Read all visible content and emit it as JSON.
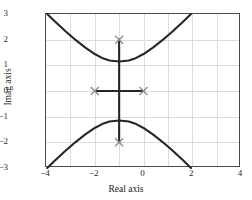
{
  "chart_data": {
    "type": "line",
    "title": "",
    "xlabel": "Real axis",
    "ylabel": "Imag axis",
    "xlim": [
      -4,
      4
    ],
    "ylim": [
      -3,
      3
    ],
    "xticks": [
      -4,
      -2,
      0,
      2,
      4
    ],
    "yticks": [
      3,
      2,
      1,
      0,
      -1,
      -2,
      -3
    ],
    "grid": true,
    "gridlines_x": [
      -4,
      -3,
      -2,
      -1,
      0,
      1,
      2,
      3,
      4
    ],
    "gridlines_y": [
      -3,
      -2,
      -1,
      0,
      1,
      2,
      3
    ],
    "legend": null,
    "colors": {
      "curve": "#262626",
      "marker": "#8a8a8a",
      "grid": "#dcdcdc",
      "frame": "#4a4a4a",
      "background": "#ffffff"
    },
    "markers": [
      {
        "label": "pole",
        "symbol": "x",
        "x": -2,
        "y": 0
      },
      {
        "label": "pole",
        "symbol": "x",
        "x": 0,
        "y": 0
      },
      {
        "label": "pole",
        "symbol": "x",
        "x": -1,
        "y": 2
      },
      {
        "label": "pole",
        "symbol": "x",
        "x": -1,
        "y": -2
      }
    ],
    "series": [
      {
        "name": "upper-branch",
        "points": [
          [
            -3.95,
            3.0
          ],
          [
            -3.6,
            2.68
          ],
          [
            -3.2,
            2.33
          ],
          [
            -2.8,
            2.0
          ],
          [
            -2.4,
            1.7
          ],
          [
            -2.0,
            1.44
          ],
          [
            -1.7,
            1.29
          ],
          [
            -1.4,
            1.19
          ],
          [
            -1.0,
            1.15
          ],
          [
            -0.6,
            1.19
          ],
          [
            -0.3,
            1.29
          ],
          [
            0.0,
            1.44
          ],
          [
            0.4,
            1.7
          ],
          [
            0.8,
            2.0
          ],
          [
            1.2,
            2.33
          ],
          [
            1.6,
            2.68
          ],
          [
            1.95,
            3.0
          ]
        ]
      },
      {
        "name": "lower-branch",
        "points": [
          [
            -3.95,
            -3.0
          ],
          [
            -3.6,
            -2.68
          ],
          [
            -3.2,
            -2.33
          ],
          [
            -2.8,
            -2.0
          ],
          [
            -2.4,
            -1.7
          ],
          [
            -2.0,
            -1.44
          ],
          [
            -1.7,
            -1.29
          ],
          [
            -1.4,
            -1.19
          ],
          [
            -1.0,
            -1.15
          ],
          [
            -0.6,
            -1.19
          ],
          [
            -0.3,
            -1.29
          ],
          [
            0.0,
            -1.44
          ],
          [
            0.4,
            -1.7
          ],
          [
            0.8,
            -2.0
          ],
          [
            1.2,
            -2.33
          ],
          [
            1.6,
            -2.68
          ],
          [
            1.95,
            -3.0
          ]
        ]
      },
      {
        "name": "real-axis-segment",
        "points": [
          [
            -2.0,
            0.0
          ],
          [
            0.0,
            0.0
          ]
        ]
      },
      {
        "name": "vertical-segment",
        "points": [
          [
            -1.0,
            -2.0
          ],
          [
            -1.0,
            2.0
          ]
        ]
      }
    ]
  }
}
